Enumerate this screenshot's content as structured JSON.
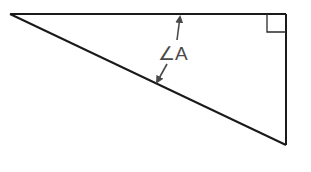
{
  "diagram": {
    "type": "right-triangle",
    "angle_label": "∠A",
    "colors": {
      "background": "#ffffff",
      "line": "#1a1a1a",
      "annotation": "#4a4a4a"
    },
    "vertices": {
      "left": [
        10,
        14
      ],
      "top_right": [
        286,
        14
      ],
      "bottom_right": [
        286,
        145
      ]
    },
    "right_angle_marker": {
      "corner": "top_right",
      "size": 18
    }
  }
}
